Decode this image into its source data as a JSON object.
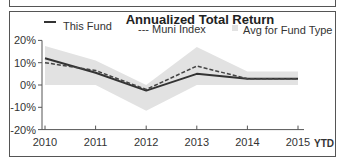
{
  "chart_data": {
    "type": "line",
    "title": "Annualized Total Return",
    "xlabel": "",
    "ylabel": "",
    "categories": [
      "2010",
      "2011",
      "2012",
      "2013",
      "2014",
      "2015"
    ],
    "x_suffix_label": "YTD",
    "y_ticks": [
      "20%",
      "10%",
      "0%",
      "-10%",
      "-20%"
    ],
    "y_tick_values": [
      20,
      10,
      0,
      -10,
      -20
    ],
    "ylim": [
      -20,
      20
    ],
    "grid": false,
    "legend_position": "top",
    "series": [
      {
        "name": "This Fund",
        "style": "solid",
        "values": [
          12,
          5.5,
          -2.5,
          5,
          2.8,
          2.8
        ]
      },
      {
        "name": "--- Muni Index",
        "style": "dashed",
        "values": [
          10,
          6.5,
          -2,
          8.5,
          2.8,
          2.8
        ]
      },
      {
        "name": "Avg for Fund Type",
        "style": "band",
        "upper": [
          17.5,
          11,
          0,
          17,
          6,
          6
        ],
        "lower": [
          0,
          0,
          -11.5,
          0,
          0,
          0
        ]
      }
    ]
  },
  "legend": {
    "this_fund": "This Fund",
    "muni_index": "--- Muni Index",
    "avg_fund_type": "Avg for Fund Type"
  },
  "colors": {
    "fund_line": "#333333",
    "muni_line": "#444444",
    "band_fill": "#e2e2e2",
    "axis": "#555555"
  }
}
